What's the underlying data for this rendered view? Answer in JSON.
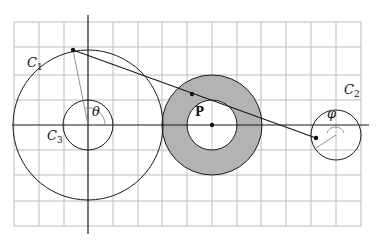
{
  "labels": {
    "c1": "C",
    "c1_sub": "1",
    "c2": "C",
    "c2_sub": "2",
    "c3": "C",
    "c3_sub": "3",
    "point_p": "P",
    "theta": "θ",
    "phi": "φ"
  },
  "colors": {
    "grid": "#bdbdbd",
    "stroke": "#1a1a1a",
    "annulus_fill": "#b3b3b3"
  }
}
